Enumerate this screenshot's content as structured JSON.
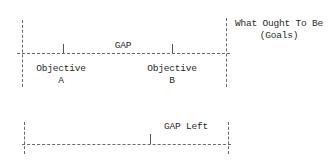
{
  "diagram": {
    "top_scale": {
      "gap_label": "GAP",
      "objective_a": {
        "title": "Objective",
        "letter": "A"
      },
      "objective_b": {
        "title": "Objective",
        "letter": "B"
      },
      "goal": {
        "line1": "What Ought To Be",
        "line2": "(Goals)"
      }
    },
    "bottom_scale": {
      "gap_left_label": "GAP Left"
    },
    "colors": {
      "line": "#6a6a6a",
      "text": "#2a2a2a",
      "background": "#ffffff"
    }
  }
}
